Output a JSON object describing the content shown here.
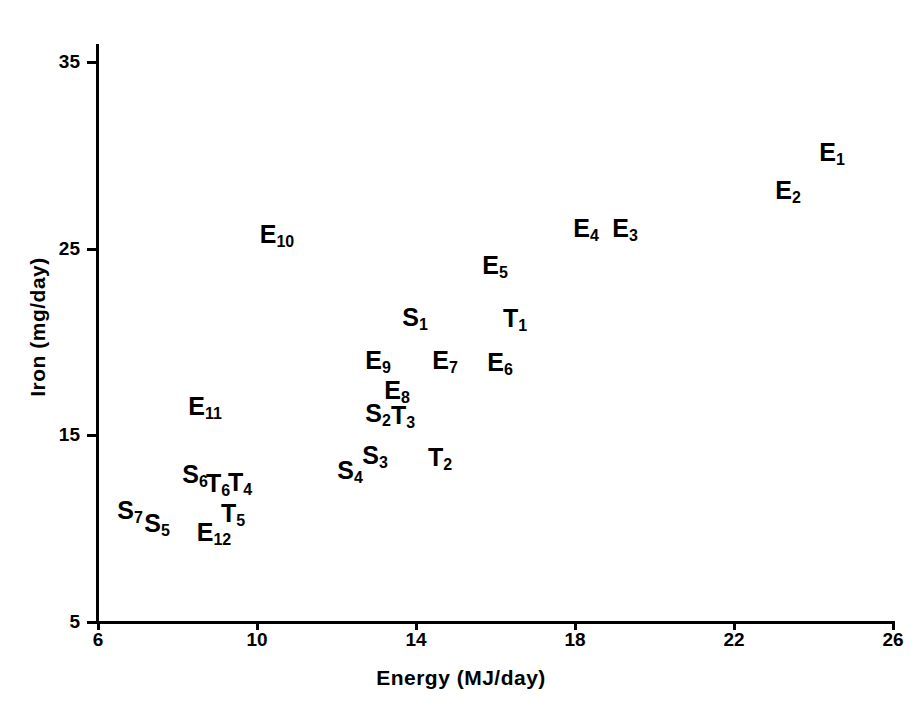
{
  "chart_data": {
    "type": "scatter",
    "title": "",
    "xlabel": "Energy (MJ/day)",
    "ylabel": "Iron (mg/day)",
    "xlim": [
      6,
      26
    ],
    "ylim": [
      5,
      35
    ],
    "xticks": [
      6,
      10,
      14,
      18,
      22,
      26
    ],
    "yticks": [
      5,
      15,
      25,
      35
    ],
    "grid": false,
    "legend": "none",
    "point_style": "text-labels",
    "points": [
      {
        "label": "E",
        "sub": "1",
        "x": 24.5,
        "y": 29.8,
        "px": 832,
        "py": 152
      },
      {
        "label": "E",
        "sub": "2",
        "x": 23.4,
        "y": 27.7,
        "px": 788,
        "py": 190
      },
      {
        "label": "E",
        "sub": "3",
        "x": 19.3,
        "y": 25.7,
        "px": 625,
        "py": 228
      },
      {
        "label": "E",
        "sub": "4",
        "x": 18.3,
        "y": 25.7,
        "px": 586,
        "py": 228
      },
      {
        "label": "E",
        "sub": "5",
        "x": 15.9,
        "y": 24.1,
        "px": 495,
        "py": 265
      },
      {
        "label": "E",
        "sub": "6",
        "x": 16.1,
        "y": 18.9,
        "px": 500,
        "py": 362
      },
      {
        "label": "E",
        "sub": "7",
        "x": 14.7,
        "y": 19.0,
        "px": 445,
        "py": 360
      },
      {
        "label": "E",
        "sub": "8",
        "x": 13.5,
        "y": 17.4,
        "px": 397,
        "py": 390
      },
      {
        "label": "E",
        "sub": "9",
        "x": 13.0,
        "y": 19.0,
        "px": 378,
        "py": 360
      },
      {
        "label": "E",
        "sub": "10",
        "x": 10.5,
        "y": 25.7,
        "px": 277,
        "py": 234
      },
      {
        "label": "E",
        "sub": "11",
        "x": 8.7,
        "y": 16.6,
        "px": 205,
        "py": 406
      },
      {
        "label": "E",
        "sub": "12",
        "x": 8.9,
        "y": 9.8,
        "px": 214,
        "py": 532
      },
      {
        "label": "S",
        "sub": "1",
        "x": 13.4,
        "y": 21.4,
        "px": 415,
        "py": 317
      },
      {
        "label": "S",
        "sub": "2",
        "x": 13.0,
        "y": 16.2,
        "px": 378,
        "py": 413
      },
      {
        "label": "S",
        "sub": "3",
        "x": 12.9,
        "y": 13.9,
        "px": 375,
        "py": 455
      },
      {
        "label": "S",
        "sub": "4",
        "x": 12.3,
        "y": 13.1,
        "px": 350,
        "py": 470
      },
      {
        "label": "S",
        "sub": "5",
        "x": 7.3,
        "y": 10.3,
        "px": 157,
        "py": 523
      },
      {
        "label": "S",
        "sub": "6",
        "x": 8.4,
        "y": 12.9,
        "px": 195,
        "py": 474
      },
      {
        "label": "S",
        "sub": "7",
        "x": 6.8,
        "y": 11.0,
        "px": 130,
        "py": 510
      },
      {
        "label": "T",
        "sub": "1",
        "x": 16.5,
        "y": 21.3,
        "px": 515,
        "py": 318
      },
      {
        "label": "T",
        "sub": "2",
        "x": 14.6,
        "y": 13.8,
        "px": 440,
        "py": 457
      },
      {
        "label": "T",
        "sub": "3",
        "x": 13.7,
        "y": 16.0,
        "px": 403,
        "py": 415
      },
      {
        "label": "T",
        "sub": "4",
        "x": 9.6,
        "y": 12.5,
        "px": 240,
        "py": 482
      },
      {
        "label": "T",
        "sub": "5",
        "x": 9.4,
        "y": 11.2,
        "px": 233,
        "py": 513
      },
      {
        "label": "T",
        "sub": "6",
        "x": 9.0,
        "y": 12.4,
        "px": 218,
        "py": 483
      }
    ]
  },
  "axes": {
    "x_title": "Energy (MJ/day)",
    "y_title": "Iron (mg/day)",
    "x_tick_labels": [
      "6",
      "10",
      "14",
      "18",
      "22",
      "26"
    ],
    "y_tick_labels": [
      "35",
      "25",
      "15",
      "5"
    ]
  },
  "colors": {
    "ink": "#000000",
    "background": "#ffffff"
  }
}
